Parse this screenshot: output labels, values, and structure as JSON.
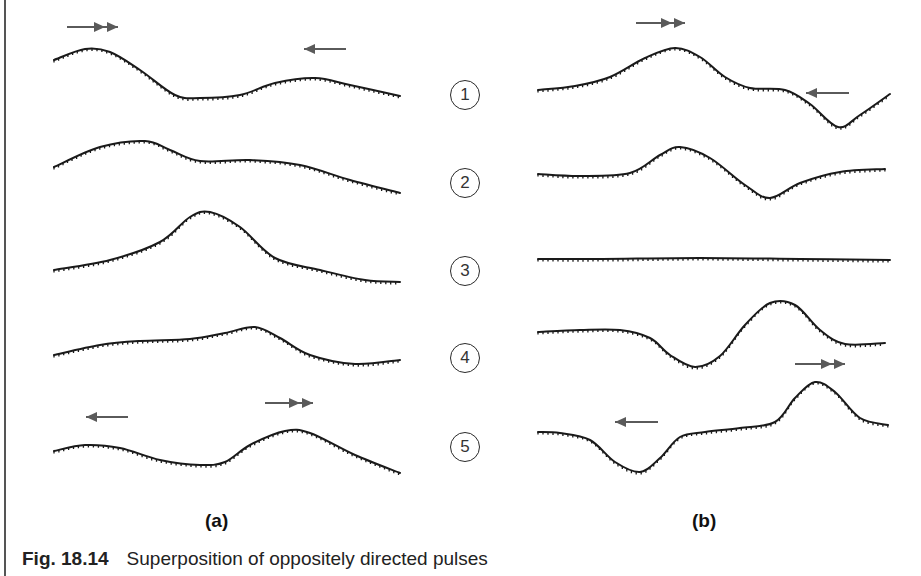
{
  "figure": {
    "caption_number": "Fig. 18.14",
    "caption_text": "Superposition of oppositely directed pulses",
    "panel_labels": {
      "a": "(a)",
      "b": "(b)"
    },
    "stages": [
      "1",
      "2",
      "3",
      "4",
      "5"
    ],
    "colors": {
      "curve": "#1a1a1a",
      "arrow": "#5a5a5a",
      "rule": "#555555"
    },
    "arrows": [
      {
        "panel": "a",
        "stage": "1",
        "type": "double-right",
        "x1": 67,
        "x2": 118,
        "y": 27
      },
      {
        "panel": "a",
        "stage": "1",
        "type": "single-left",
        "x1": 346,
        "x2": 304,
        "y": 49
      },
      {
        "panel": "b",
        "stage": "1",
        "type": "double-right",
        "x1": 636,
        "x2": 685,
        "y": 23
      },
      {
        "panel": "b",
        "stage": "1",
        "type": "single-left",
        "x1": 849,
        "x2": 806,
        "y": 93
      },
      {
        "panel": "b",
        "stage": "4",
        "type": "double-right",
        "x1": 795,
        "x2": 845,
        "y": 364
      },
      {
        "panel": "a",
        "stage": "5",
        "type": "single-left",
        "x1": 128,
        "x2": 86,
        "y": 417
      },
      {
        "panel": "a",
        "stage": "5",
        "type": "double-right",
        "x1": 265,
        "x2": 313,
        "y": 403
      },
      {
        "panel": "b",
        "stage": "5",
        "type": "single-left",
        "x1": 658,
        "x2": 615,
        "y": 422
      }
    ],
    "curves": {
      "a": [
        {
          "stage": "1",
          "points": [
            [
              54,
              60
            ],
            [
              85,
              49
            ],
            [
              110,
              52
            ],
            [
              140,
              70
            ],
            [
              175,
              95
            ],
            [
              200,
              98
            ],
            [
              240,
              95
            ],
            [
              275,
              83
            ],
            [
              315,
              78
            ],
            [
              350,
              85
            ],
            [
              400,
              96
            ]
          ]
        },
        {
          "stage": "2",
          "points": [
            [
              54,
              167
            ],
            [
              100,
              147
            ],
            [
              145,
              141
            ],
            [
              170,
              150
            ],
            [
              200,
              161
            ],
            [
              250,
              160
            ],
            [
              300,
              165
            ],
            [
              350,
              180
            ],
            [
              400,
              193
            ]
          ]
        },
        {
          "stage": "3",
          "points": [
            [
              54,
              270
            ],
            [
              110,
              260
            ],
            [
              160,
              242
            ],
            [
              190,
              217
            ],
            [
              210,
              212
            ],
            [
              240,
              227
            ],
            [
              275,
              258
            ],
            [
              320,
              270
            ],
            [
              365,
              280
            ],
            [
              400,
              282
            ]
          ]
        },
        {
          "stage": "4",
          "points": [
            [
              54,
              355
            ],
            [
              100,
              345
            ],
            [
              140,
              341
            ],
            [
              190,
              339
            ],
            [
              225,
              333
            ],
            [
              255,
              327
            ],
            [
              280,
              338
            ],
            [
              310,
              355
            ],
            [
              355,
              364
            ],
            [
              400,
              360
            ]
          ]
        },
        {
          "stage": "5",
          "points": [
            [
              54,
              451
            ],
            [
              85,
              445
            ],
            [
              120,
              448
            ],
            [
              160,
              460
            ],
            [
              200,
              465
            ],
            [
              225,
              462
            ],
            [
              250,
              445
            ],
            [
              285,
              431
            ],
            [
              310,
              433
            ],
            [
              355,
              455
            ],
            [
              400,
              473
            ]
          ]
        }
      ],
      "b": [
        {
          "stage": "1",
          "points": [
            [
              538,
              90
            ],
            [
              575,
              86
            ],
            [
              610,
              77
            ],
            [
              645,
              58
            ],
            [
              675,
              48
            ],
            [
              700,
              57
            ],
            [
              725,
              77
            ],
            [
              750,
              88
            ],
            [
              785,
              90
            ],
            [
              810,
              104
            ],
            [
              838,
              127
            ],
            [
              860,
              115
            ],
            [
              890,
              94
            ]
          ]
        },
        {
          "stage": "2",
          "points": [
            [
              538,
              174
            ],
            [
              580,
              176
            ],
            [
              630,
              173
            ],
            [
              660,
              155
            ],
            [
              680,
              147
            ],
            [
              710,
              158
            ],
            [
              745,
              185
            ],
            [
              770,
              198
            ],
            [
              800,
              183
            ],
            [
              840,
              172
            ],
            [
              885,
              169
            ]
          ]
        },
        {
          "stage": "3",
          "points": [
            [
              538,
              259
            ],
            [
              600,
              259
            ],
            [
              700,
              258
            ],
            [
              800,
              259
            ],
            [
              890,
              260
            ]
          ]
        },
        {
          "stage": "4",
          "points": [
            [
              538,
              332
            ],
            [
              580,
              330
            ],
            [
              620,
              330
            ],
            [
              650,
              338
            ],
            [
              670,
              355
            ],
            [
              695,
              367
            ],
            [
              720,
              356
            ],
            [
              745,
              325
            ],
            [
              770,
              303
            ],
            [
              795,
              305
            ],
            [
              820,
              330
            ],
            [
              845,
              344
            ],
            [
              885,
              343
            ]
          ]
        },
        {
          "stage": "5",
          "points": [
            [
              538,
              432
            ],
            [
              560,
              433
            ],
            [
              590,
              440
            ],
            [
              615,
              462
            ],
            [
              640,
              472
            ],
            [
              660,
              458
            ],
            [
              680,
              437
            ],
            [
              705,
              432
            ],
            [
              740,
              428
            ],
            [
              775,
              422
            ],
            [
              795,
              398
            ],
            [
              815,
              382
            ],
            [
              835,
              392
            ],
            [
              860,
              418
            ],
            [
              888,
              425
            ]
          ]
        }
      ]
    }
  }
}
